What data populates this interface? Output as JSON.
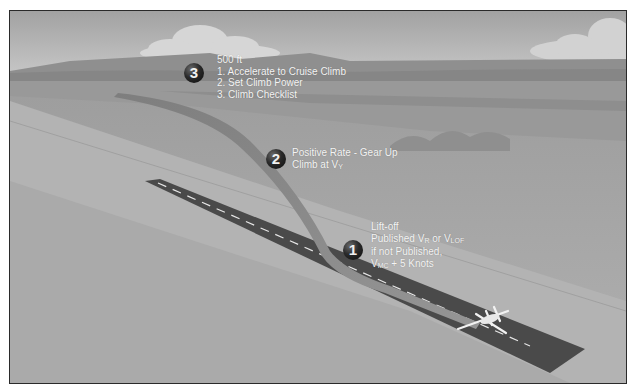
{
  "figure": {
    "colors": {
      "sky": "#b8b8b8",
      "ground": "#a6a6a6",
      "runway": "#4a4a4a",
      "flight_path": "#8e8e8e",
      "badge": "#1a1a1a",
      "label_text": "#f4f4f4"
    },
    "steps": [
      {
        "number": "1",
        "lines": [
          "Lift-off",
          "Published V",
          "R",
          " or V",
          "LOF",
          "if not Published,",
          "V",
          "MC",
          " + 5 Knots"
        ]
      },
      {
        "number": "2",
        "lines": [
          "Positive Rate - Gear Up",
          "Climb at V",
          "Y"
        ]
      },
      {
        "number": "3",
        "lines": [
          "500 ft",
          "1.  Accelerate to Cruise Climb",
          "2.  Set Climb Power",
          "3.  Climb Checklist"
        ]
      }
    ]
  }
}
